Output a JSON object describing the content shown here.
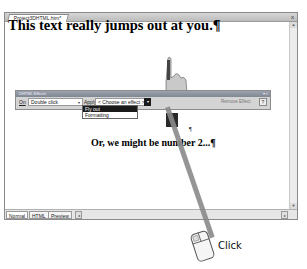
{
  "window": {
    "doc_tab": "Project3DHTML.htm*",
    "close": "x"
  },
  "document": {
    "heading": "This text really jumps out at you.¶",
    "pilcrow": "¶",
    "line2": "Or, we might be number 2...¶"
  },
  "effects_toolbar": {
    "title": "DHTML Effects",
    "title_controls": "▾ ×",
    "on_label": "On",
    "on_value": "Double click",
    "apply_label": "Apply",
    "effect_value": "< Choose an effect >",
    "remove_effect": "Remove Effect",
    "help_icon": "?"
  },
  "effect_dropdown": {
    "items": [
      {
        "label": "Fly out",
        "selected": true
      },
      {
        "label": "Formatting",
        "selected": false
      }
    ]
  },
  "bottom_bar": {
    "tabs": [
      {
        "label": "Normal",
        "active": true
      },
      {
        "label": "HTML",
        "active": false
      },
      {
        "label": "Preview",
        "active": false
      }
    ]
  },
  "annotation": {
    "action_label": "Click",
    "icon": "mouse-icon"
  },
  "colors": {
    "selected_bg": "#1a1a1a",
    "toolbar_bg": "#d4d4d4",
    "title_bar": "#8a919c",
    "pointer_line": "#8a8a8a"
  }
}
